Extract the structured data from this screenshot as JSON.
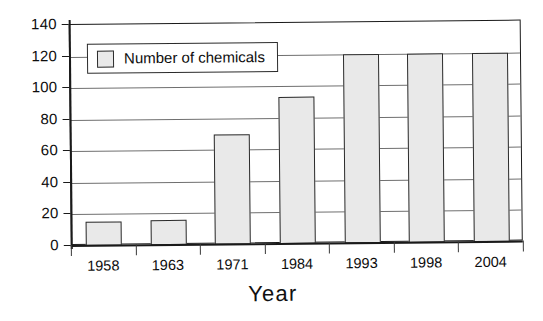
{
  "chart_data": {
    "type": "bar",
    "title": "",
    "subtitle": "",
    "xlabel": "Year",
    "ylabel": "",
    "categories": [
      "1958",
      "1963",
      "1971",
      "1984",
      "1993",
      "1998",
      "2004"
    ],
    "values": [
      15,
      16,
      70,
      93,
      120,
      120,
      120
    ],
    "series": [
      {
        "name": "Number of chemicals",
        "values": [
          15,
          16,
          70,
          93,
          120,
          120,
          120
        ]
      }
    ],
    "ylim": [
      0,
      140
    ],
    "yticks": [
      0,
      20,
      40,
      60,
      80,
      100,
      120,
      140
    ],
    "ytick_labels": [
      "0",
      "20",
      "40",
      "60",
      "80",
      "100",
      "120",
      "140"
    ],
    "grid": "horizontal",
    "legend_position": "top-left-inside",
    "legend_entries": [
      "Number of chemicals"
    ],
    "annotations": [],
    "colors": {
      "bar_fill": "#e9e9e9",
      "bar_border": "#2b2b2b",
      "gridline": "#6f6f6f",
      "axis": "#1a1a1a",
      "background": "#ffffff",
      "text": "#0d0d0d"
    }
  }
}
